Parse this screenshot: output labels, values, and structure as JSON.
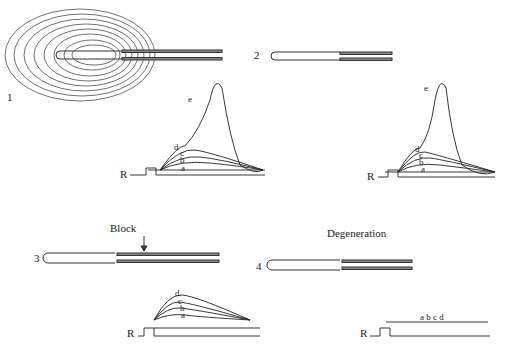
{
  "panels": [
    {
      "number": "1",
      "description": "Pacinian corpuscle intact with lamellae",
      "curve_labels": [
        "a",
        "b",
        "c",
        "d",
        "e"
      ]
    },
    {
      "number": "2",
      "description": "Lamellae removed",
      "curve_labels": [
        "a",
        "b",
        "c",
        "d",
        "e"
      ]
    },
    {
      "number": "3",
      "description": "Node blocked",
      "annotation": "Block",
      "curve_labels": [
        "a",
        "b",
        "c",
        "d"
      ]
    },
    {
      "number": "4",
      "description": "Degenerated nerve ending",
      "annotation": "Degeneration",
      "curve_labels_inline": "a b c d"
    }
  ],
  "stimulus_label": "R",
  "colors": {
    "ink": "#222222",
    "background": "#ffffff"
  }
}
